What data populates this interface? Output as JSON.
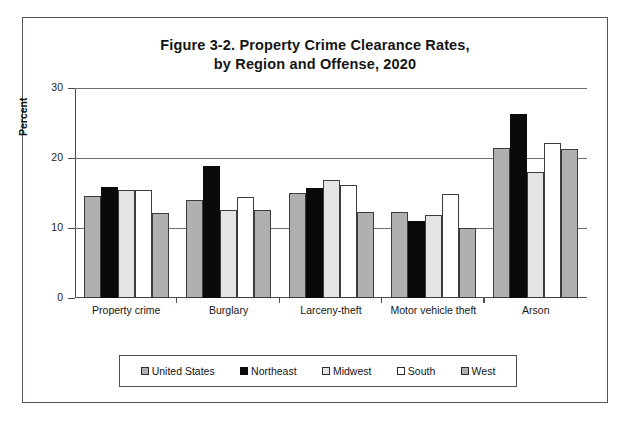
{
  "page": {
    "top_text_fragment": "",
    "background_color": "#ffffff",
    "frame_color": "#53565a"
  },
  "chart_data": {
    "type": "bar",
    "title": "Figure 3-2. Property Crime Clearance Rates,",
    "title_line2": "by Region and Offense, 2020",
    "xlabel": "",
    "ylabel": "Percent",
    "ylim": [
      0,
      30
    ],
    "yticks": [
      0,
      10,
      20,
      30
    ],
    "ytick_labels": [
      "0",
      "10",
      "20",
      "30"
    ],
    "grid": true,
    "legend_position": "bottom",
    "categories": [
      "Property crime",
      "Burglary",
      "Larceny-theft",
      "Motor vehicle theft",
      "Arson"
    ],
    "series": [
      {
        "name": "United States",
        "color": "#b0b0b0",
        "values": [
          14.6,
          14.0,
          15.0,
          12.3,
          21.4
        ]
      },
      {
        "name": "Northeast",
        "color": "#0a0a0a",
        "values": [
          15.8,
          18.9,
          15.7,
          11.0,
          26.3
        ]
      },
      {
        "name": "Midwest",
        "color": "#e4e4e4",
        "values": [
          15.5,
          12.6,
          16.9,
          11.8,
          18.0
        ]
      },
      {
        "name": "South",
        "color": "#ffffff",
        "values": [
          15.5,
          14.5,
          16.1,
          14.8,
          22.2
        ]
      },
      {
        "name": "West",
        "color": "#b0b0b0",
        "values": [
          12.1,
          12.6,
          12.3,
          10.0,
          21.3
        ]
      }
    ]
  }
}
